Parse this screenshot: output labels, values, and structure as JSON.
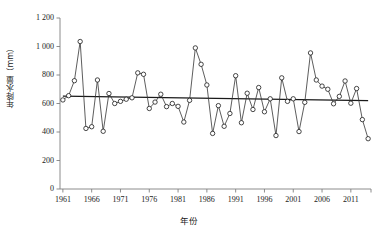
{
  "chart_data": {
    "type": "line",
    "title": "",
    "xlabel": "年份",
    "ylabel": "年降水量（mm）",
    "ylabel_text": "年降水量(mm)",
    "xlim": [
      1960.5,
      2014.5
    ],
    "ylim": [
      0,
      1200
    ],
    "grid": false,
    "legend": null,
    "marker": "open-circle",
    "y_ticks": [
      0,
      200,
      400,
      600,
      800,
      1000,
      1200
    ],
    "y_tick_labels": [
      "0",
      "200",
      "400",
      "600",
      "800",
      "1 000",
      "1 200"
    ],
    "x_ticks": [
      1961,
      1966,
      1971,
      1976,
      1981,
      1986,
      1991,
      1996,
      2001,
      2006,
      2011
    ],
    "x_tick_labels": [
      "1961",
      "1966",
      "1971",
      "1976",
      "1981",
      "1986",
      "1991",
      "1996",
      "2001",
      "2006",
      "2011"
    ],
    "x": [
      1961,
      1962,
      1963,
      1964,
      1965,
      1966,
      1967,
      1968,
      1969,
      1970,
      1971,
      1972,
      1973,
      1974,
      1975,
      1976,
      1977,
      1978,
      1979,
      1980,
      1981,
      1982,
      1983,
      1984,
      1985,
      1986,
      1987,
      1988,
      1989,
      1990,
      1991,
      1992,
      1993,
      1994,
      1995,
      1996,
      1997,
      1998,
      1999,
      2000,
      2001,
      2002,
      2003,
      2004,
      2005,
      2006,
      2007,
      2008,
      2009,
      2010,
      2011,
      2012,
      2013,
      2014
    ],
    "values": [
      625,
      655,
      760,
      1035,
      425,
      437,
      765,
      405,
      670,
      600,
      615,
      630,
      640,
      815,
      805,
      565,
      610,
      665,
      578,
      600,
      580,
      470,
      622,
      990,
      875,
      730,
      390,
      585,
      440,
      530,
      795,
      465,
      672,
      558,
      712,
      542,
      633,
      375,
      780,
      615,
      633,
      403,
      608,
      955,
      765,
      722,
      700,
      598,
      650,
      758,
      602,
      705,
      487,
      353
    ],
    "series": [
      {
        "name": "年降水量",
        "values": [
          625,
          655,
          760,
          1035,
          425,
          437,
          765,
          405,
          670,
          600,
          615,
          630,
          640,
          815,
          805,
          565,
          610,
          665,
          578,
          600,
          580,
          470,
          622,
          990,
          875,
          730,
          390,
          585,
          440,
          530,
          795,
          465,
          672,
          558,
          712,
          542,
          633,
          375,
          780,
          615,
          633,
          403,
          608,
          955,
          765,
          722,
          700,
          598,
          650,
          758,
          602,
          705,
          487,
          353
        ]
      },
      {
        "name": "趋势线",
        "type": "trend-line",
        "x": [
          1961,
          2014
        ],
        "values": [
          652,
          620
        ]
      }
    ],
    "last_point": 690
  },
  "axis": {
    "y_title": "年降水量（mm）",
    "x_title": "年份"
  },
  "colors": {
    "line": "#333333",
    "marker_fill": "#ffffff",
    "marker_stroke": "#1a1a1a",
    "trend": "#1a1a1a",
    "axis": "#808080",
    "background": "#ffffff"
  }
}
